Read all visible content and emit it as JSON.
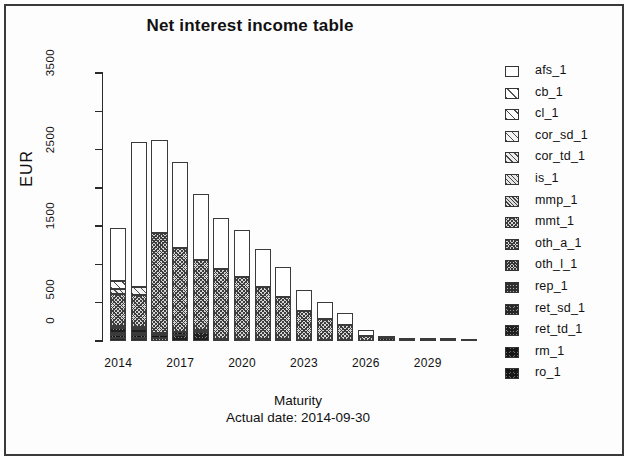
{
  "title": "Net interest income table",
  "xlabel": "Maturity",
  "sublabel": "Actual date:  2014-09-30",
  "ylabel": "EUR",
  "legend": [
    {
      "label": "afs_1",
      "pattern": 0
    },
    {
      "label": "cb_1",
      "pattern": 1
    },
    {
      "label": "cl_1",
      "pattern": 2
    },
    {
      "label": "cor_sd_1",
      "pattern": 3
    },
    {
      "label": "cor_td_1",
      "pattern": 4
    },
    {
      "label": "is_1",
      "pattern": 5
    },
    {
      "label": "mmp_1",
      "pattern": 6
    },
    {
      "label": "mmt_1",
      "pattern": 7
    },
    {
      "label": "oth_a_1",
      "pattern": 8
    },
    {
      "label": "oth_l_1",
      "pattern": 9
    },
    {
      "label": "rep_1",
      "pattern": 10
    },
    {
      "label": "ret_sd_1",
      "pattern": 11
    },
    {
      "label": "ret_td_1",
      "pattern": 12
    },
    {
      "label": "rm_1",
      "pattern": 13
    },
    {
      "label": "ro_1",
      "pattern": 13
    }
  ],
  "yticks": [
    {
      "value": 0,
      "label": "0"
    },
    {
      "value": 500,
      "label": "500"
    },
    {
      "value": 1000,
      "label": ""
    },
    {
      "value": 1500,
      "label": "1500"
    },
    {
      "value": 2000,
      "label": ""
    },
    {
      "value": 2500,
      "label": "2500"
    },
    {
      "value": 3000,
      "label": ""
    },
    {
      "value": 3500,
      "label": "3500"
    }
  ],
  "xticks": [
    {
      "label": "2014",
      "index": 0
    },
    {
      "label": "2017",
      "index": 3
    },
    {
      "label": "2020",
      "index": 6
    },
    {
      "label": "2023",
      "index": 9
    },
    {
      "label": "2026",
      "index": 12
    },
    {
      "label": "2029",
      "index": 15
    }
  ],
  "chart_data": {
    "type": "bar",
    "title": "Net interest income table",
    "xlabel": "Maturity",
    "ylabel": "EUR",
    "ylim": [
      0,
      3600
    ],
    "grid": false,
    "legend_position": "right",
    "stacked": true,
    "categories": [
      "2014",
      "2015",
      "2016",
      "2017",
      "2018",
      "2019",
      "2020",
      "2021",
      "2022",
      "2023",
      "2024",
      "2025",
      "2026",
      "2027",
      "2028",
      "2029",
      "2030",
      "2031"
    ],
    "series": [
      {
        "name": "afs_1",
        "values": [
          700,
          1880,
          1190,
          980,
          730,
          615,
          560,
          460,
          370,
          255,
          205,
          150,
          58,
          22,
          10,
          6,
          4,
          2
        ]
      },
      {
        "name": "cb_1",
        "values": [
          100,
          45,
          30,
          12,
          8,
          6,
          5,
          4,
          3,
          2,
          2,
          2,
          1,
          0,
          0,
          0,
          0,
          0
        ]
      },
      {
        "name": "cl_1",
        "values": [
          70,
          100,
          50,
          20,
          12,
          8,
          6,
          5,
          4,
          3,
          2,
          2,
          1,
          0,
          0,
          0,
          0,
          0
        ]
      },
      {
        "name": "cor_sd_1",
        "values": [
          30,
          20,
          12,
          8,
          6,
          4,
          3,
          2,
          2,
          1,
          1,
          1,
          0,
          0,
          0,
          0,
          0,
          0
        ]
      },
      {
        "name": "cor_td_1",
        "values": [
          25,
          18,
          10,
          6,
          4,
          3,
          2,
          2,
          1,
          1,
          1,
          0,
          0,
          0,
          0,
          0,
          0,
          0
        ]
      },
      {
        "name": "is_1",
        "values": [
          20,
          15,
          9,
          5,
          4,
          3,
          2,
          1,
          1,
          1,
          0,
          0,
          0,
          0,
          0,
          0,
          0,
          0
        ]
      },
      {
        "name": "mmp_1",
        "values": [
          15,
          12,
          7,
          4,
          3,
          2,
          2,
          1,
          1,
          0,
          0,
          0,
          0,
          0,
          0,
          0,
          0,
          0
        ]
      },
      {
        "name": "mmt_1",
        "values": [
          300,
          290,
          1190,
          1170,
          1000,
          905,
          830,
          690,
          560,
          390,
          285,
          205,
          75,
          30,
          14,
          8,
          5,
          3
        ]
      },
      {
        "name": "oth_a_1",
        "values": [
          40,
          35,
          20,
          12,
          8,
          6,
          4,
          3,
          2,
          2,
          1,
          1,
          0,
          0,
          0,
          0,
          0,
          0
        ]
      },
      {
        "name": "oth_l_1",
        "values": [
          35,
          30,
          18,
          10,
          7,
          5,
          4,
          3,
          2,
          1,
          1,
          1,
          0,
          0,
          0,
          0,
          0,
          0
        ]
      },
      {
        "name": "rep_1",
        "values": [
          30,
          28,
          15,
          9,
          6,
          4,
          3,
          2,
          2,
          1,
          1,
          0,
          0,
          0,
          0,
          0,
          0,
          0
        ]
      },
      {
        "name": "ret_sd_1",
        "values": [
          60,
          50,
          30,
          18,
          12,
          9,
          7,
          5,
          4,
          3,
          2,
          1,
          1,
          0,
          0,
          0,
          0,
          0
        ]
      },
      {
        "name": "ret_td_1",
        "values": [
          55,
          45,
          28,
          70,
          110,
          28,
          22,
          18,
          14,
          10,
          7,
          5,
          2,
          1,
          0,
          0,
          0,
          0
        ]
      },
      {
        "name": "rm_1",
        "values": [
          40,
          32,
          20,
          12,
          8,
          6,
          5,
          4,
          3,
          2,
          1,
          1,
          0,
          0,
          0,
          0,
          0,
          0
        ]
      }
    ],
    "totals": [
      1480,
      2600,
      2630,
      2340,
      1920,
      1605,
      1455,
      1200,
      970,
      672,
      509,
      369,
      138,
      53,
      24,
      14,
      9,
      5
    ]
  },
  "bars": [
    {
      "x": "2014",
      "total": 1480,
      "segments": [
        {
          "p": 11,
          "v": 45
        },
        {
          "p": 13,
          "v": 35
        },
        {
          "p": 9,
          "v": 30
        },
        {
          "p": 12,
          "v": 55
        },
        {
          "p": 5,
          "v": 35
        },
        {
          "p": 7,
          "v": 420
        },
        {
          "p": 4,
          "v": 60
        },
        {
          "p": 2,
          "v": 100
        },
        {
          "p": 0,
          "v": 700
        }
      ]
    },
    {
      "x": "2015",
      "total": 2600,
      "segments": [
        {
          "p": 10,
          "v": 40
        },
        {
          "p": 13,
          "v": 38
        },
        {
          "p": 8,
          "v": 30
        },
        {
          "p": 12,
          "v": 48
        },
        {
          "p": 6,
          "v": 30
        },
        {
          "p": 7,
          "v": 414
        },
        {
          "p": 3,
          "v": 100
        },
        {
          "p": 0,
          "v": 1900
        }
      ]
    },
    {
      "x": "2016",
      "total": 2630,
      "segments": [
        {
          "p": 10,
          "v": 35
        },
        {
          "p": 13,
          "v": 40
        },
        {
          "p": 9,
          "v": 28
        },
        {
          "p": 7,
          "v": 1307
        },
        {
          "p": 0,
          "v": 1220
        }
      ]
    },
    {
      "x": "2017",
      "total": 2340,
      "segments": [
        {
          "p": 12,
          "v": 80
        },
        {
          "p": 13,
          "v": 35
        },
        {
          "p": 7,
          "v": 1105
        },
        {
          "p": 0,
          "v": 1120
        }
      ]
    },
    {
      "x": "2018",
      "total": 1920,
      "segments": [
        {
          "p": 12,
          "v": 115
        },
        {
          "p": 13,
          "v": 25
        },
        {
          "p": 7,
          "v": 920
        },
        {
          "p": 0,
          "v": 860
        }
      ]
    },
    {
      "x": "2019",
      "total": 1605,
      "segments": [
        {
          "p": 13,
          "v": 30
        },
        {
          "p": 7,
          "v": 910
        },
        {
          "p": 0,
          "v": 665
        }
      ]
    },
    {
      "x": "2020",
      "total": 1455,
      "segments": [
        {
          "p": 13,
          "v": 28
        },
        {
          "p": 7,
          "v": 812
        },
        {
          "p": 0,
          "v": 615
        }
      ]
    },
    {
      "x": "2021",
      "total": 1200,
      "segments": [
        {
          "p": 13,
          "v": 25
        },
        {
          "p": 7,
          "v": 680
        },
        {
          "p": 0,
          "v": 495
        }
      ]
    },
    {
      "x": "2022",
      "total": 970,
      "segments": [
        {
          "p": 13,
          "v": 22
        },
        {
          "p": 7,
          "v": 548
        },
        {
          "p": 0,
          "v": 400
        }
      ]
    },
    {
      "x": "2023",
      "total": 672,
      "segments": [
        {
          "p": 13,
          "v": 18
        },
        {
          "p": 7,
          "v": 374
        },
        {
          "p": 0,
          "v": 280
        }
      ]
    },
    {
      "x": "2024",
      "total": 509,
      "segments": [
        {
          "p": 13,
          "v": 14
        },
        {
          "p": 7,
          "v": 275
        },
        {
          "p": 0,
          "v": 220
        }
      ]
    },
    {
      "x": "2025",
      "total": 369,
      "segments": [
        {
          "p": 13,
          "v": 10
        },
        {
          "p": 7,
          "v": 199
        },
        {
          "p": 0,
          "v": 160
        }
      ]
    },
    {
      "x": "2026",
      "total": 138,
      "segments": [
        {
          "p": 13,
          "v": 6
        },
        {
          "p": 7,
          "v": 62
        },
        {
          "p": 0,
          "v": 70
        }
      ]
    },
    {
      "x": "2027",
      "total": 53,
      "segments": [
        {
          "p": 13,
          "v": 4
        },
        {
          "p": 12,
          "v": 34
        },
        {
          "p": 0,
          "v": 15
        }
      ]
    },
    {
      "x": "2028",
      "total": 24,
      "segments": [
        {
          "p": 13,
          "v": 3
        },
        {
          "p": 12,
          "v": 15
        },
        {
          "p": 0,
          "v": 6
        }
      ]
    },
    {
      "x": "2029",
      "total": 14,
      "segments": [
        {
          "p": 13,
          "v": 2
        },
        {
          "p": 12,
          "v": 8
        },
        {
          "p": 0,
          "v": 4
        }
      ]
    },
    {
      "x": "2030",
      "total": 9,
      "segments": [
        {
          "p": 13,
          "v": 2
        },
        {
          "p": 12,
          "v": 5
        },
        {
          "p": 0,
          "v": 2
        }
      ]
    },
    {
      "x": "2031",
      "total": 5,
      "segments": [
        {
          "p": 13,
          "v": 1
        },
        {
          "p": 12,
          "v": 3
        },
        {
          "p": 0,
          "v": 1
        }
      ]
    }
  ]
}
